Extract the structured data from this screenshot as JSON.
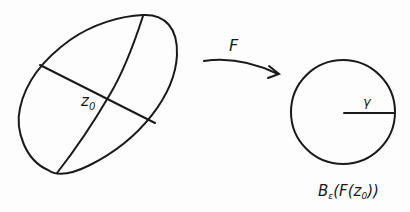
{
  "diagram": {
    "domain_label": "z0",
    "domain_label_main": "z",
    "domain_label_sub": "0",
    "map_label": "F",
    "radius_label": "γ",
    "ball_label_B": "B",
    "ball_label_sub": "ε",
    "ball_label_rest_1": "(F(z",
    "ball_label_rest_sub": "0",
    "ball_label_rest_2": "))",
    "stroke_color": "#1a1a1a"
  }
}
